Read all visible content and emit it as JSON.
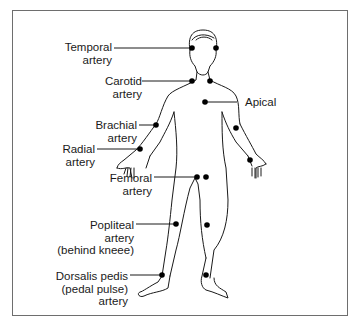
{
  "labels": {
    "temporal": {
      "line1": "Temporal",
      "line2": "artery"
    },
    "carotid": {
      "line1": "Carotid",
      "line2": "artery"
    },
    "apical": {
      "line1": "Apical"
    },
    "brachial": {
      "line1": "Brachial",
      "line2": "artery"
    },
    "radial": {
      "line1": "Radial",
      "line2": "artery"
    },
    "femoral": {
      "line1": "Femoral",
      "line2": "artery"
    },
    "popliteal": {
      "line1": "Popliteal",
      "line2": "artery",
      "line3": "(behind kneee)"
    },
    "dorsalis": {
      "line1": "Dorsalis pedis",
      "line2": "(pedal pulse)",
      "line3": "artery"
    }
  },
  "colors": {
    "line": "#1a1a1a",
    "frame": "#6e6e6e",
    "dot": "#000000"
  }
}
